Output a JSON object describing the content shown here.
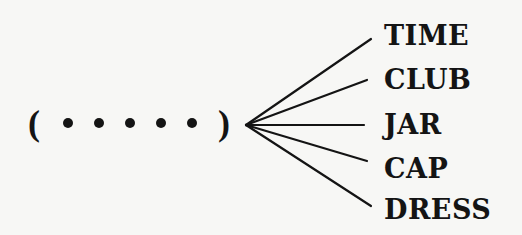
{
  "diagram": {
    "pattern": {
      "open": "(",
      "close": ")",
      "slots": 5,
      "dot_glyph": "•"
    },
    "words": [
      "TIME",
      "CLUB",
      "JAR",
      "CAP",
      "DRESS"
    ],
    "colors": {
      "ink": "#141414",
      "background": "#f7f7f5"
    }
  }
}
